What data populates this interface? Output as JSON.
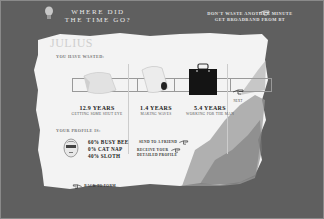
{
  "header": {
    "title_line1": "WHERE DID",
    "title_line2": "THE TIME GO?",
    "promo_line1": "DON'T WASTE ANOTHER MINUTE",
    "promo_line2": "GET BROADBAND FROM BT"
  },
  "user": {
    "name": "JULIUS",
    "wasted_label": "YOU HAVE WASTED:"
  },
  "wasted_items": [
    {
      "years": "12.9 YEARS",
      "desc": "GETTING SOME SHUT EYE",
      "icon": "pillow-icon"
    },
    {
      "years": "1.4 YEARS",
      "desc": "MAKING WAVES",
      "icon": "toilet-roll-icon"
    },
    {
      "years": "5.4 YEARS",
      "desc": "WORKING FOR THE MAN",
      "icon": "briefcase-icon"
    }
  ],
  "next_label": "NEXT",
  "profile": {
    "heading": "YOUR PROFILE IS:",
    "traits": [
      "60% BUSY BEE",
      "0% CAT NAP",
      "40% SLOTH"
    ]
  },
  "actions": {
    "send_friend": "SEND TO A FRIEND",
    "receive_line1": "RECEIVE YOUR",
    "receive_line2": "DETAILED PROFILE",
    "back": "BACK TO FORM"
  },
  "colors": {
    "background": "#5f5f5f",
    "paper": "#f4f4f4",
    "text_dark": "#222222"
  }
}
